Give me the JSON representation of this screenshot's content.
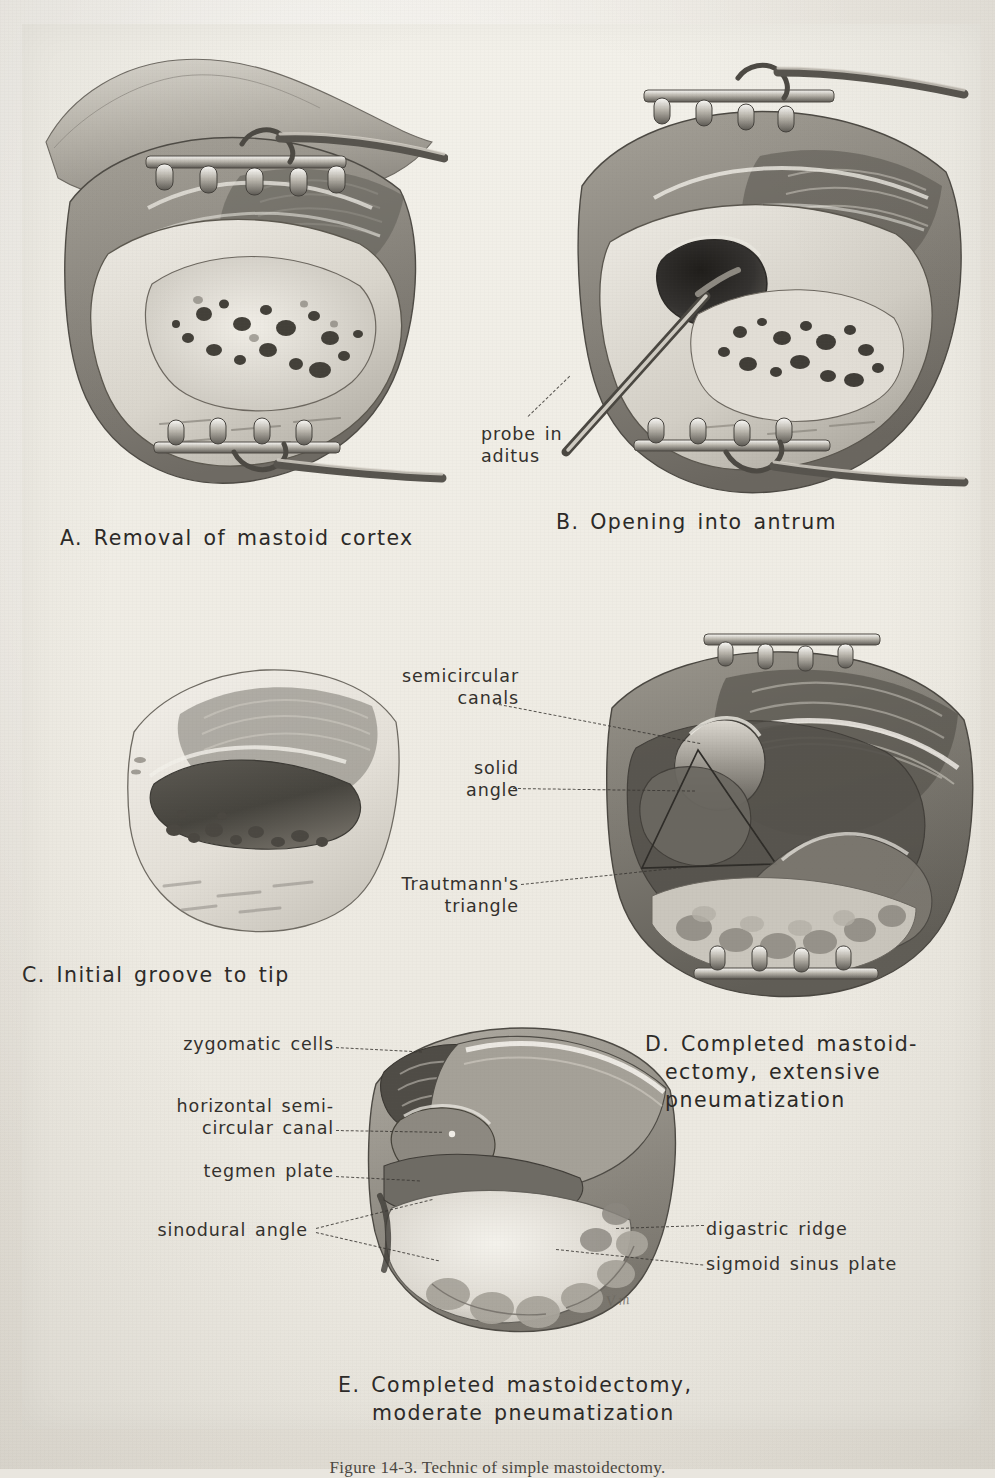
{
  "figure": {
    "caption": "Figure 14-3.   Technic of simple mastoidectomy.",
    "artist_signature": "V m"
  },
  "panels": [
    {
      "id": "A",
      "title": "A. Removal of mastoid cortex",
      "callouts": []
    },
    {
      "id": "B",
      "title": "B. Opening into antrum",
      "callouts": [
        {
          "label_line1": "probe in",
          "label_line2": "aditus"
        }
      ]
    },
    {
      "id": "C",
      "title": "C. Initial groove to tip",
      "callouts": []
    },
    {
      "id": "D",
      "title_line1": "D. Completed mastoid-",
      "title_line2": "ectomy, extensive",
      "title_line3": "pneumatization",
      "callouts": [
        {
          "label_line1": "semicircular",
          "label_line2": "canals"
        },
        {
          "label_line1": "solid",
          "label_line2": "angle"
        },
        {
          "label_line1": "Trautmann's",
          "label_line2": "triangle"
        }
      ]
    },
    {
      "id": "E",
      "title_line1": "E. Completed mastoidectomy,",
      "title_line2": "moderate pneumatization",
      "callouts_left": [
        {
          "label": "zygomatic cells"
        },
        {
          "label_line1": "horizontal semi-",
          "label_line2": "circular canal"
        },
        {
          "label": "tegmen plate"
        },
        {
          "label": "sinodural angle"
        }
      ],
      "callouts_right": [
        {
          "label": "digastric ridge"
        },
        {
          "label": "sigmoid sinus plate"
        }
      ]
    }
  ],
  "colors": {
    "paper": "#efece5",
    "plate": "#f3f1ea",
    "ink": "#2f2d2a",
    "leader": "#3a3733",
    "shadow_dark": "#3c3a36",
    "mid_gray": "#8c8880",
    "light_gray": "#cfcbc2"
  }
}
